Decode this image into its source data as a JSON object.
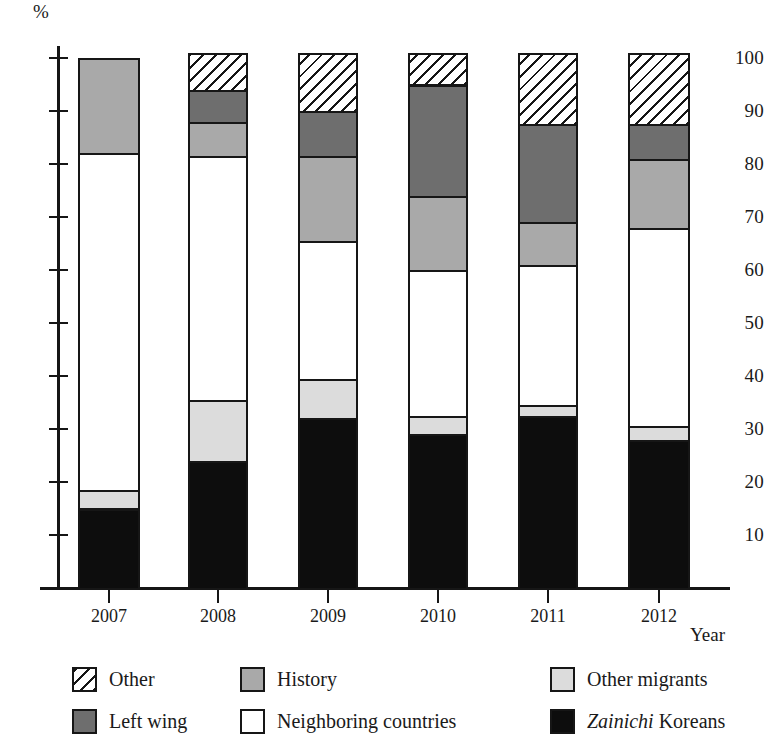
{
  "chart_data": {
    "type": "bar",
    "stacked": true,
    "title": "",
    "subtitle": "",
    "xlabel": "Year",
    "ylabel": "%",
    "categories": [
      "2007",
      "2008",
      "2009",
      "2010",
      "2011",
      "2012"
    ],
    "ylim": [
      0,
      101
    ],
    "y_ticks": [
      10,
      20,
      30,
      40,
      50,
      60,
      70,
      80,
      90,
      100
    ],
    "grid": false,
    "legend_position": "bottom",
    "units": "percent",
    "series": [
      {
        "name": "Zainichi Koreans",
        "color": "#0d0d0d",
        "pattern": "solid-black",
        "values": [
          15.0,
          24.0,
          32.0,
          29.0,
          32.5,
          28.0
        ]
      },
      {
        "name": "Other migrants",
        "color": "#dcdcdc",
        "pattern": "solid-light-gray",
        "values": [
          3.5,
          11.5,
          7.5,
          3.5,
          2.0,
          2.5
        ]
      },
      {
        "name": "Neighboring countries",
        "color": "#ffffff",
        "pattern": "solid-white",
        "values": [
          63.5,
          46.0,
          26.0,
          27.5,
          26.5,
          37.5
        ]
      },
      {
        "name": "History",
        "color": "#a9a9a9",
        "pattern": "solid-medium-gray",
        "values": [
          18.0,
          6.5,
          16.0,
          14.0,
          8.0,
          13.0
        ]
      },
      {
        "name": "Left wing",
        "color": "#6e6e6e",
        "pattern": "solid-dark-gray",
        "values": [
          0.0,
          6.0,
          8.5,
          21.0,
          18.5,
          6.5
        ]
      },
      {
        "name": "Other",
        "color": "#ffffff",
        "pattern": "diagonal-hatch",
        "values": [
          0.0,
          7.0,
          11.0,
          6.0,
          13.5,
          13.5
        ]
      }
    ],
    "stack_totals": [
      100.0,
      101.0,
      101.0,
      101.0,
      101.0,
      101.0
    ],
    "cumulative_tops": [
      [
        15.0,
        18.5,
        82.0,
        100.0,
        100.0,
        100.0
      ],
      [
        24.0,
        35.5,
        81.5,
        88.0,
        94.0,
        101.0
      ],
      [
        32.0,
        39.5,
        65.5,
        81.5,
        90.0,
        101.0
      ],
      [
        29.0,
        32.5,
        60.0,
        74.0,
        95.0,
        101.0
      ],
      [
        32.5,
        34.5,
        61.0,
        69.0,
        87.5,
        101.0
      ],
      [
        28.0,
        30.5,
        68.0,
        81.0,
        87.5,
        101.0
      ]
    ]
  },
  "axes": {
    "y_unit_label": "%",
    "x_title": "Year",
    "y_tick_labels": [
      "100",
      "90",
      "80",
      "70",
      "60",
      "50",
      "40",
      "30",
      "20",
      "10"
    ],
    "x_tick_labels": [
      "2007",
      "2008",
      "2009",
      "2010",
      "2011",
      "2012"
    ]
  },
  "legend": {
    "items": [
      {
        "label": "Other",
        "swatch": "hatch-swatch",
        "key": "other"
      },
      {
        "label": "Left wing",
        "swatch": "dark-gray-swatch",
        "key": "leftwing"
      },
      {
        "label": "History",
        "swatch": "medium-gray-swatch",
        "key": "history"
      },
      {
        "label": "Neighboring countries",
        "swatch": "white-swatch",
        "key": "neighbor"
      },
      {
        "label": "Other migrants",
        "swatch": "light-gray-swatch",
        "key": "othermig"
      },
      {
        "label": "Zainichi Koreans",
        "swatch": "black-swatch",
        "key": "zainichi",
        "italic_prefix": "Zainichi",
        "plain_suffix": " Koreans"
      }
    ]
  }
}
